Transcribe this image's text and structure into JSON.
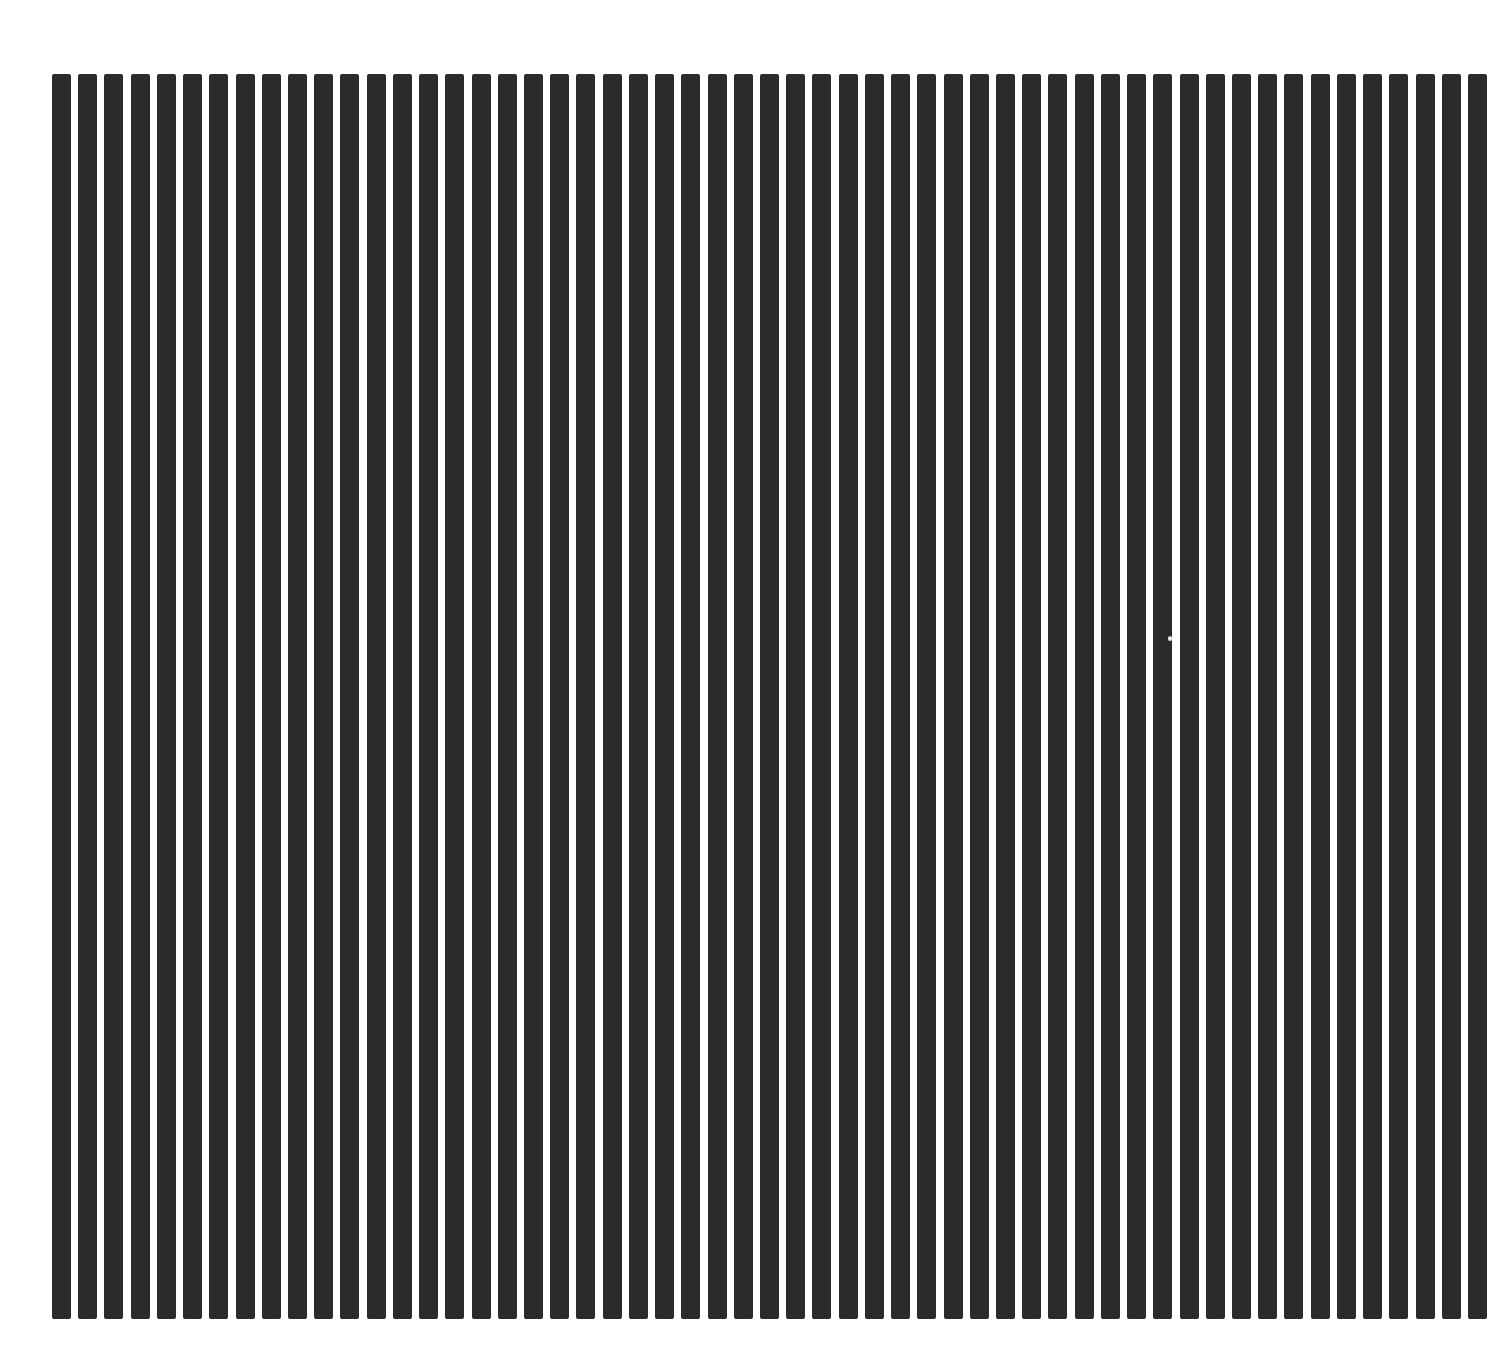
{
  "figure": {
    "background_color": "#ffffff",
    "bar_color": "#2b2b2b",
    "bar_count": 55,
    "first_bar_left": 52,
    "last_bar_left": 1468,
    "bar_width": 19,
    "bar_top": 74,
    "bar_bottom": 1319
  },
  "artifacts": [
    {
      "x": 1168,
      "y": 636,
      "w": 4,
      "h": 5,
      "color": "#f2f2f2"
    }
  ]
}
